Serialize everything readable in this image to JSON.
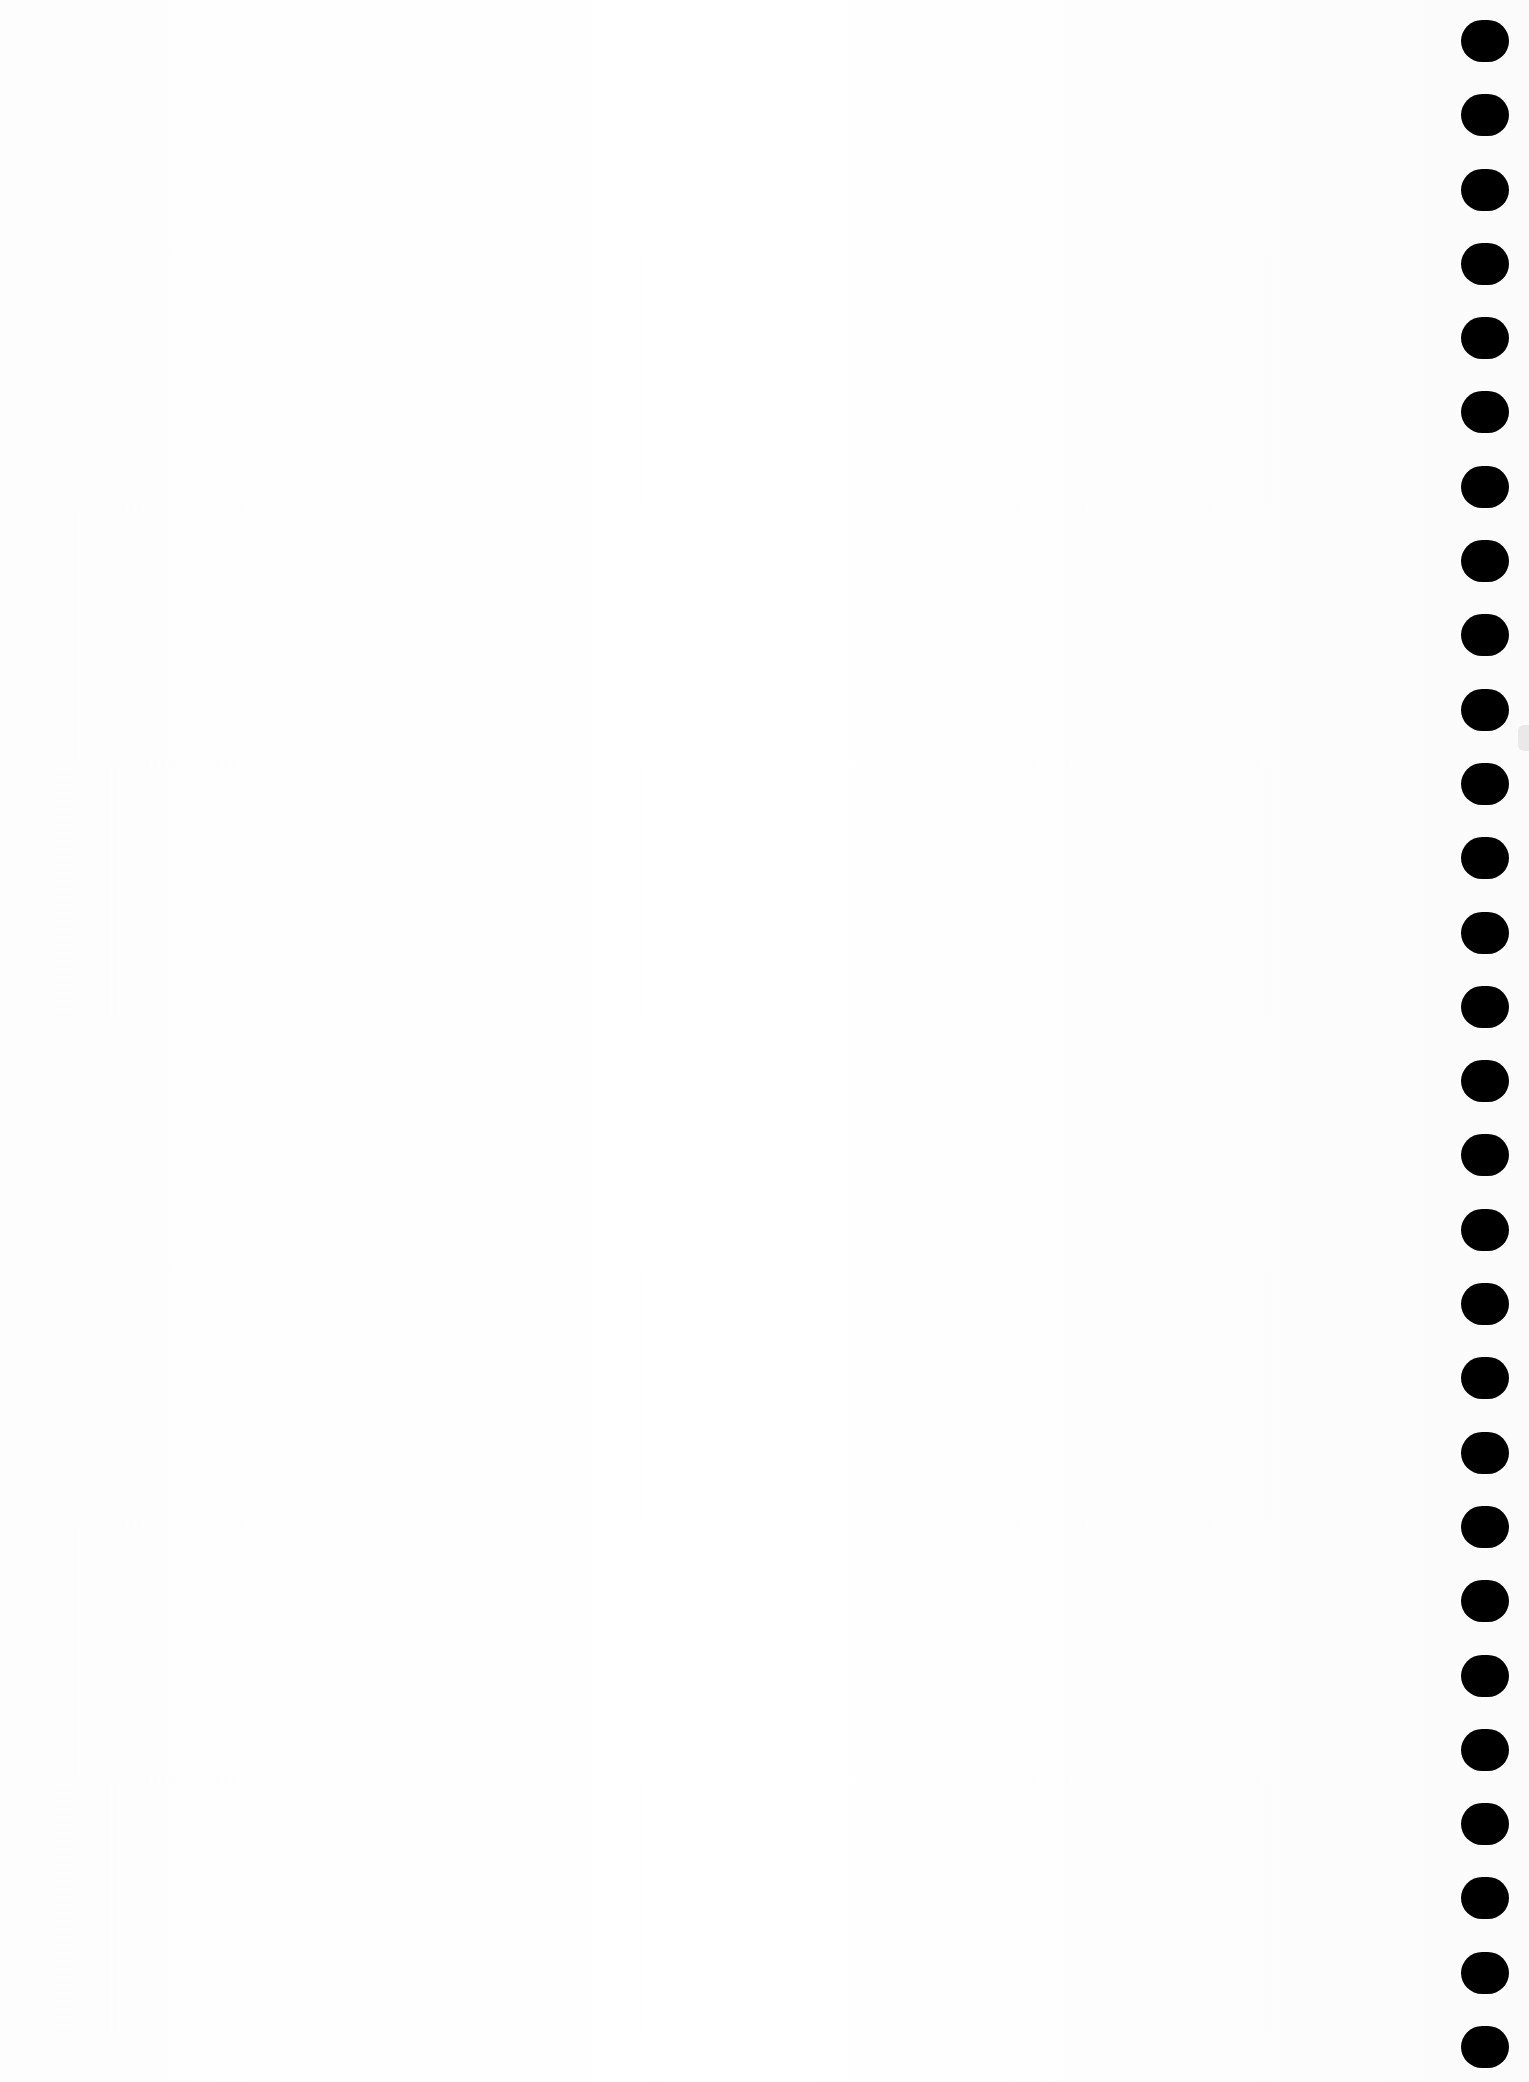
{
  "page": {
    "type": "blank notebook page (spiral-bound)",
    "background_color": "#fefefe",
    "bleed_through_text": {
      "visible": true,
      "legible": false,
      "lines": [
        "",
        "",
        ""
      ]
    },
    "footer_mark": "",
    "binding": {
      "side": "right",
      "hole_count": 28,
      "hole_color": "#000000"
    }
  }
}
